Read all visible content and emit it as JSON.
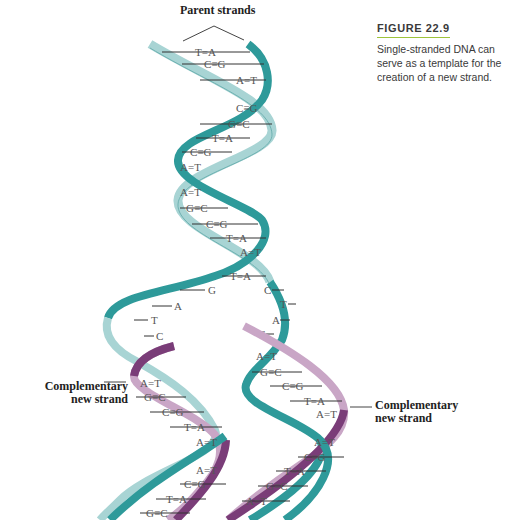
{
  "caption": {
    "title": "FIGURE 22.9",
    "text": "Single-stranded DNA can serve as a template for the creation of a new strand.",
    "accent_color": "#9ec33a"
  },
  "labels": {
    "parent_strands": "Parent strands",
    "complementary_left_line1": "Complementary",
    "complementary_left_line2": "new strand",
    "complementary_right_line1": "Complementary",
    "complementary_right_line2": "new strand"
  },
  "colors": {
    "parent_strand_dark": "#2e9a9a",
    "parent_strand_light": "#a8d4d4",
    "new_strand_dark": "#7a3d78",
    "new_strand_light": "#c9a6c6",
    "base_text": "#555555"
  },
  "parent_helix_pairs": [
    "T=A",
    "C≡G",
    "A=T",
    "C≡G",
    "G≡C",
    "T=A",
    "C≡G",
    "A=T",
    "A=T",
    "G≡C",
    "C≡G",
    "T=A",
    "A=T",
    "T=A"
  ],
  "separated_left_bases": [
    "G",
    "A",
    "T",
    "C"
  ],
  "separated_right_bases": [
    "C",
    "T",
    "A",
    "G"
  ],
  "left_daughter_pairs": [
    "A=T",
    "G≡C",
    "C≡G",
    "T=A",
    "A=T",
    "A=T",
    "C≡G",
    "T=A",
    "G≡C",
    "A=T"
  ],
  "right_daughter_pairs": [
    "A=T",
    "G≡C",
    "C≡G",
    "T=A",
    "A=T",
    "A=T",
    "C≡G",
    "T=A",
    "G≡C",
    "A=T"
  ]
}
